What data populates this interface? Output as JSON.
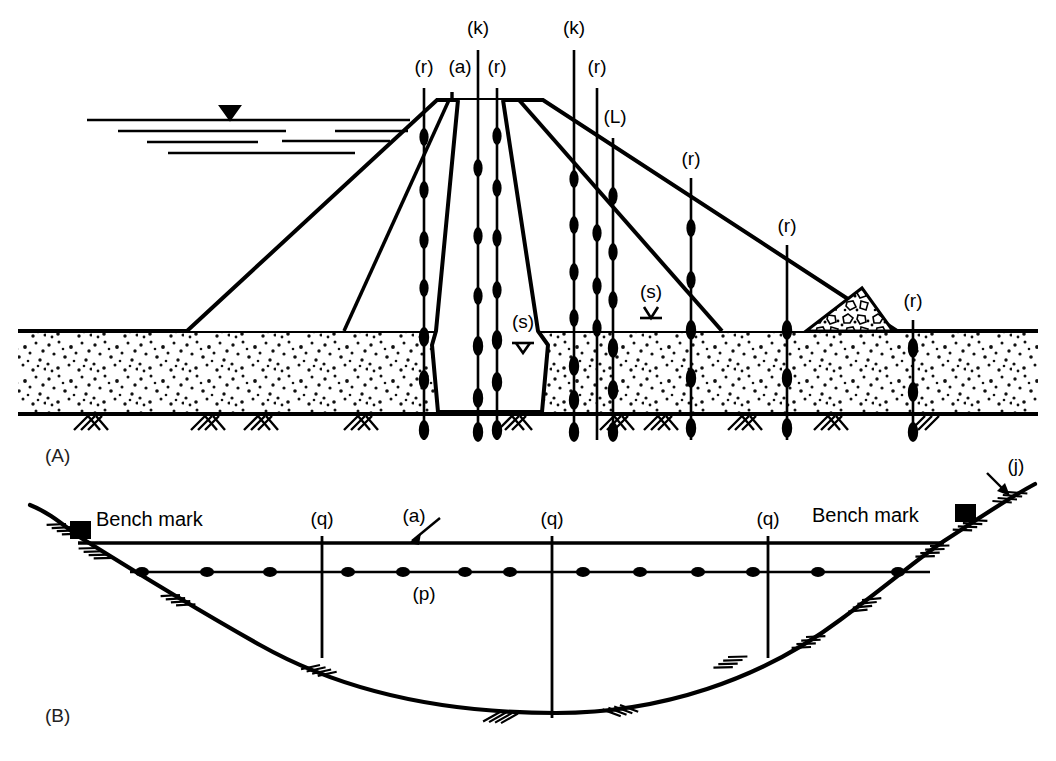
{
  "figure": {
    "panels": [
      {
        "id": "A",
        "label": "(A)",
        "caption": "Maximum cross-section of embankment dam showing instrument locations"
      },
      {
        "id": "B",
        "label": "(B)",
        "caption": "Longitudinal profile along dam axis showing bench marks and settlement points"
      }
    ]
  },
  "panel_a": {
    "label": "(A)",
    "callouts": [
      {
        "key": "r1",
        "text": "(r)",
        "x": 424,
        "y": 73,
        "note": "piezometer upstream shell"
      },
      {
        "key": "a1",
        "text": "(a)",
        "x": 460,
        "y": 73,
        "note": "crest reference point"
      },
      {
        "key": "r2",
        "text": "(r)",
        "x": 496,
        "y": 73,
        "note": "piezometer core upstream"
      },
      {
        "key": "k1",
        "text": "(k)",
        "x": 478,
        "y": 34,
        "note": "inclinometer core"
      },
      {
        "key": "k2",
        "text": "(k)",
        "x": 574,
        "y": 34,
        "note": "inclinometer downstream"
      },
      {
        "key": "r3",
        "text": "(r)",
        "x": 590,
        "y": 73,
        "note": "piezometer downstream shell"
      },
      {
        "key": "L1",
        "text": "(L)",
        "x": 613,
        "y": 123,
        "note": "settlement gauge"
      },
      {
        "key": "r4",
        "text": "(r)",
        "x": 690,
        "y": 163,
        "note": "piezometer downstream slope"
      },
      {
        "key": "r5",
        "text": "(r)",
        "x": 786,
        "y": 230,
        "note": "piezometer toe area"
      },
      {
        "key": "r6",
        "text": "(r)",
        "x": 912,
        "y": 305,
        "note": "piezometer beyond toe"
      },
      {
        "key": "s1",
        "text": "(s)",
        "x": 524,
        "y": 325,
        "note": "water level in core"
      },
      {
        "key": "s2",
        "text": "(s)",
        "x": 652,
        "y": 292,
        "note": "phreatic surface downstream"
      }
    ],
    "reservoir_symbol": "water-surface-triangle",
    "ground_surface_y": 330,
    "bedrock_y": 415
  },
  "panel_b": {
    "label": "(B)",
    "bench_mark_left_label": "Bench mark",
    "bench_mark_right_label": "Bench mark",
    "callouts": [
      {
        "key": "q1",
        "text": "(q)",
        "x": 322,
        "y": 521,
        "note": "cross-arm settlement device"
      },
      {
        "key": "a2",
        "text": "(a)",
        "x": 414,
        "y": 521,
        "note": "dam crest line"
      },
      {
        "key": "q2",
        "text": "(q)",
        "x": 552,
        "y": 521,
        "note": "cross-arm settlement device"
      },
      {
        "key": "q3",
        "text": "(q)",
        "x": 768,
        "y": 521,
        "note": "cross-arm settlement device"
      },
      {
        "key": "p1",
        "text": "(p)",
        "x": 424,
        "y": 597,
        "note": "surface settlement points line"
      },
      {
        "key": "j1",
        "text": "(j)",
        "x": 1012,
        "y": 470,
        "note": "abutment reference"
      }
    ]
  },
  "colors": {
    "ink": "#000000",
    "paper": "#ffffff",
    "fill_foundation": "#ffffff",
    "rockfill": "#ffffff"
  }
}
